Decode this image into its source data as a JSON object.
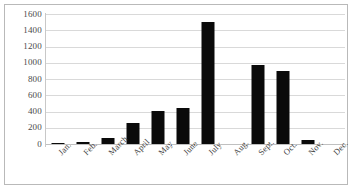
{
  "chart_data": {
    "type": "bar",
    "title": "",
    "subtitle": "",
    "xlabel": "",
    "ylabel": "",
    "categories": [
      "Jan.",
      "Feb.",
      "March",
      "April",
      "May",
      "June",
      "July",
      "Aug.",
      "Sept.",
      "Oct.",
      "Nov.",
      "Dec."
    ],
    "values": [
      10,
      20,
      70,
      260,
      410,
      440,
      1500,
      0,
      975,
      900,
      55,
      0
    ],
    "series": [
      {
        "name": "",
        "values": [
          10,
          20,
          70,
          260,
          410,
          440,
          1500,
          0,
          975,
          900,
          55,
          0
        ]
      }
    ],
    "ylim": [
      0,
      1600
    ],
    "ytick_labels": [
      "1600",
      "1400",
      "1200",
      "1000",
      "800",
      "600",
      "400",
      "200",
      "0"
    ],
    "ytick_values": [
      1600,
      1400,
      1200,
      1000,
      800,
      600,
      400,
      200,
      0
    ],
    "grid": true,
    "legend": false,
    "legend_position": "none",
    "bar_color": "#0a0a0a",
    "gridline_color": "#d9d9d9",
    "axis_color": "#c8c8c8",
    "border_color": "#b9b9b9",
    "background_color": "#ffffff",
    "xlabel_rotation": -45
  }
}
